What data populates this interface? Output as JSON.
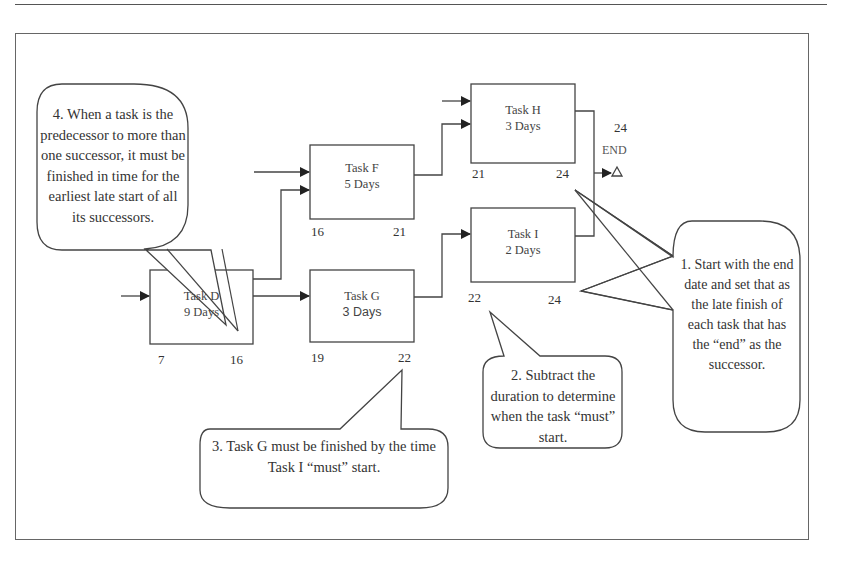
{
  "diagram": {
    "type": "network-diagram-backward-pass",
    "tasks": [
      {
        "id": "D",
        "name": "Task D",
        "duration": "9 Days",
        "late_start": "7",
        "late_finish": "16"
      },
      {
        "id": "F",
        "name": "Task F",
        "duration": "5 Days",
        "late_start": "16",
        "late_finish": "21"
      },
      {
        "id": "G",
        "name": "Task G",
        "duration": "3 Days",
        "late_start": "19",
        "late_finish": "22"
      },
      {
        "id": "H",
        "name": "Task H",
        "duration": "3 Days",
        "late_start": "21",
        "late_finish": "24"
      },
      {
        "id": "I",
        "name": "Task I",
        "duration": "2 Days",
        "late_start": "22",
        "late_finish": "24"
      }
    ],
    "end": {
      "label": "END",
      "value": "24"
    },
    "edges": [
      {
        "from": "D",
        "to": "F"
      },
      {
        "from": "D",
        "to": "G"
      },
      {
        "from": "F",
        "to": "H"
      },
      {
        "from": "G",
        "to": "I"
      },
      {
        "from": "H",
        "to": "END"
      },
      {
        "from": "I",
        "to": "END"
      }
    ],
    "callouts": [
      {
        "number": 1,
        "text": "1. Start with the end date and set that as the late finish of each task that has the “end” as the successor."
      },
      {
        "number": 2,
        "text": "2. Subtract the duration to determine when the task “must” start."
      },
      {
        "number": 3,
        "text": "3. Task G must be finished by the time Task I “must” start."
      },
      {
        "number": 4,
        "text": "4. When a task is the predecessor to more than one successor, it must be finished in time for the earliest late start of all its successors."
      }
    ],
    "colors": {
      "line": "#444444",
      "text": "#333333",
      "background": "#ffffff"
    }
  }
}
